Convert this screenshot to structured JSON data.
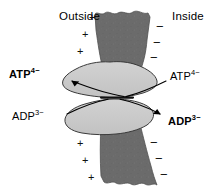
{
  "figure": {
    "width": 221,
    "height": 194
  },
  "colors": {
    "membrane": "#6b6b6b",
    "membrane_outline": "#4a4a4a",
    "protein_lobe": "#c9c9c9",
    "protein_outline": "#3a3a3a",
    "stroke": "#000000",
    "background": "#ffffff"
  },
  "labels": {
    "outside": "Outside",
    "inside": "Inside"
  },
  "species": {
    "atp_out": {
      "name": "ATP",
      "charge": "4−",
      "bold": true
    },
    "atp_in": {
      "name": "ATP",
      "charge": "4−",
      "bold": false
    },
    "adp_out": {
      "name": "ADP",
      "charge": "3−",
      "bold": false
    },
    "adp_in": {
      "name": "ADP",
      "charge": "3−",
      "bold": true
    }
  },
  "charges": {
    "positive_symbol": "+",
    "negative_symbol": "−",
    "positive_count_top": 3,
    "positive_count_bottom": 3,
    "negative_count_top": 3,
    "negative_count_bottom": 3,
    "positive_side": "Outside",
    "negative_side": "Inside"
  },
  "transport": {
    "atp_direction": "inside-to-outside",
    "adp_direction": "outside-to-inside",
    "arrows": [
      {
        "id": "atp-efflux",
        "label": "ATP4-",
        "from": "pore",
        "to": "outside",
        "arrowhead": true
      },
      {
        "id": "atp-approach",
        "label": "ATP4-",
        "from": "inside",
        "to": "pore",
        "arrowhead": false
      },
      {
        "id": "adp-approach",
        "label": "ADP3-",
        "from": "outside",
        "to": "pore",
        "arrowhead": false
      },
      {
        "id": "adp-efflux",
        "label": "ADP3-",
        "from": "pore",
        "to": "inside",
        "arrowhead": true
      }
    ]
  }
}
